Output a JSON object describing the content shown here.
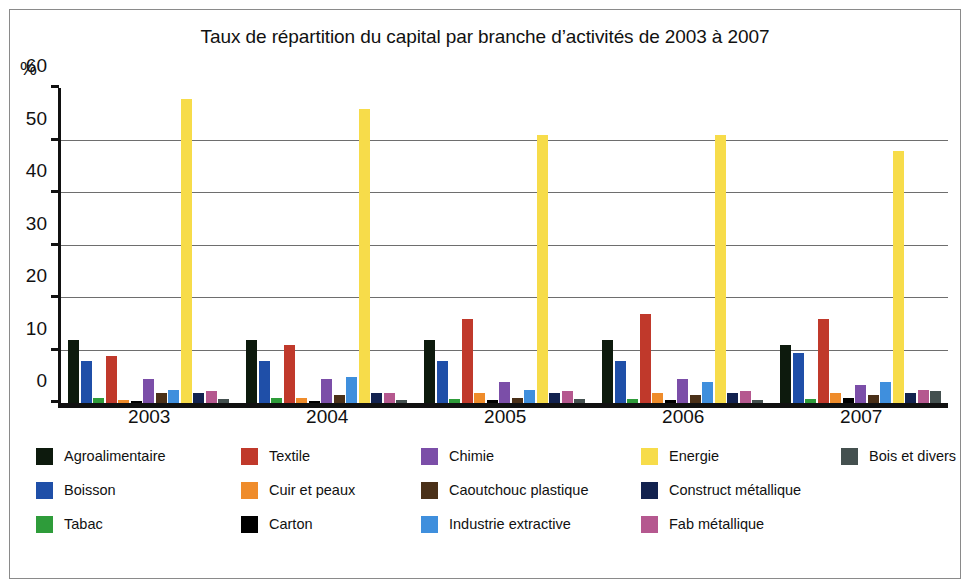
{
  "chart_data": {
    "type": "bar",
    "title": "Taux de répartition du capital par branche d’activités de 2003 à 2007",
    "xlabel": "",
    "ylabel": "%",
    "ylim": [
      0,
      60
    ],
    "yticks": [
      0,
      10,
      20,
      30,
      40,
      50,
      60
    ],
    "grid": true,
    "grid_values": [
      10,
      20,
      30,
      40,
      50
    ],
    "legend_position": "bottom",
    "categories": [
      "2003",
      "2004",
      "2005",
      "2006",
      "2007"
    ],
    "series": [
      {
        "name": "Agroalimentaire",
        "color": "#0d1a0d",
        "values": [
          12,
          12,
          12,
          12,
          11
        ]
      },
      {
        "name": "Boisson",
        "color": "#1f4fa8",
        "values": [
          8,
          8,
          8,
          8,
          9.5
        ]
      },
      {
        "name": "Tabac",
        "color": "#2e9c3a",
        "values": [
          1,
          1,
          0.7,
          0.8,
          0.7
        ]
      },
      {
        "name": "Textile",
        "color": "#c0392b",
        "values": [
          9,
          11,
          16,
          17,
          16
        ]
      },
      {
        "name": "Cuir et peaux",
        "color": "#ef8c2b",
        "values": [
          0.5,
          1,
          2,
          2,
          2
        ]
      },
      {
        "name": "Carton",
        "color": "#000000",
        "values": [
          0.3,
          0.3,
          0.5,
          0.6,
          1
        ]
      },
      {
        "name": "Chimie",
        "color": "#7b4ea8",
        "values": [
          4.5,
          4.5,
          4,
          4.5,
          3.5
        ]
      },
      {
        "name": "Caoutchouc plastique",
        "color": "#4a3018",
        "values": [
          2,
          1.5,
          1,
          1.5,
          1.5
        ]
      },
      {
        "name": "Industrie  extractive",
        "color": "#3f8fdd",
        "values": [
          2.5,
          5,
          2.5,
          4,
          4
        ]
      },
      {
        "name": "Energie",
        "color": "#f7dc4a",
        "values": [
          58,
          56,
          51,
          51,
          48
        ]
      },
      {
        "name": "Construct métallique",
        "color": "#12224f",
        "values": [
          2,
          2,
          2,
          2,
          2
        ]
      },
      {
        "name": "Fab métallique",
        "color": "#b5588f",
        "values": [
          2.2,
          2,
          2.2,
          2.2,
          2.5
        ]
      },
      {
        "name": "Bois et divers",
        "color": "#44504f",
        "values": [
          0.8,
          0.5,
          0.7,
          0.6,
          2.3
        ]
      }
    ]
  },
  "legend": {
    "columns": [
      [
        {
          "label": "Agroalimentaire",
          "color": "#0d1a0d",
          "icon": "legend-swatch-agroalimentaire"
        },
        {
          "label": "Boisson",
          "color": "#1f4fa8",
          "icon": "legend-swatch-boisson"
        },
        {
          "label": "Tabac",
          "color": "#2e9c3a",
          "icon": "legend-swatch-tabac"
        }
      ],
      [
        {
          "label": "Textile",
          "color": "#c0392b",
          "icon": "legend-swatch-textile"
        },
        {
          "label": "Cuir et peaux",
          "color": "#ef8c2b",
          "icon": "legend-swatch-cuir-et-peaux"
        },
        {
          "label": "Carton",
          "color": "#000000",
          "icon": "legend-swatch-carton"
        }
      ],
      [
        {
          "label": "Chimie",
          "color": "#7b4ea8",
          "icon": "legend-swatch-chimie"
        },
        {
          "label": "Caoutchouc plastique",
          "color": "#4a3018",
          "icon": "legend-swatch-caoutchouc-plastique"
        },
        {
          "label": "Industrie  extractive",
          "color": "#3f8fdd",
          "icon": "legend-swatch-industrie-extractive"
        }
      ],
      [
        {
          "label": "Energie",
          "color": "#f7dc4a",
          "icon": "legend-swatch-energie"
        },
        {
          "label": "Construct métallique",
          "color": "#12224f",
          "icon": "legend-swatch-construct-metallique"
        },
        {
          "label": "Fab métallique",
          "color": "#b5588f",
          "icon": "legend-swatch-fab-metallique"
        }
      ],
      [
        {
          "label": "Bois et divers",
          "color": "#44504f",
          "icon": "legend-swatch-bois-et-divers"
        }
      ]
    ]
  }
}
